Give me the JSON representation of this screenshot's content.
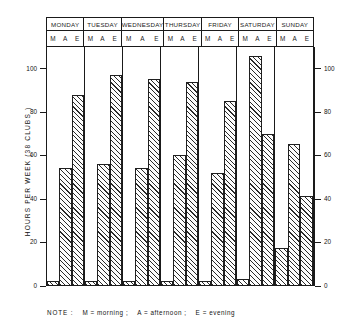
{
  "chart_data": {
    "type": "bar",
    "title": "",
    "subtitle": "",
    "xlabel": "",
    "ylabel": "HOURS  PER  WEEK  (38 CLUBS )",
    "ylim": [
      0,
      110
    ],
    "y_ticks": [
      0,
      20,
      40,
      60,
      80,
      100
    ],
    "y_tick_labels": [
      "0",
      "20",
      "40",
      "60",
      "80",
      "100"
    ],
    "dual_y_axis": true,
    "grid": false,
    "legend": "none",
    "categories": [
      "MONDAY",
      "TUESDAY",
      "WEDNESDAY",
      "THURSDAY",
      "FRIDAY",
      "SATURDAY",
      "SUNDAY"
    ],
    "subcategories": [
      "M",
      "A",
      "E"
    ],
    "series": [
      {
        "name": "M",
        "values": [
          2,
          2,
          2,
          2,
          2,
          3,
          17
        ]
      },
      {
        "name": "A",
        "values": [
          54,
          56,
          54,
          60,
          52,
          106,
          65
        ]
      },
      {
        "name": "E",
        "values": [
          88,
          97,
          95,
          94,
          85,
          70,
          41
        ]
      }
    ],
    "annotation": "NOTE :   M = morning ;   A = afternoon ;   E = evening"
  },
  "axis": {
    "title": "HOURS  PER  WEEK  (38 CLUBS )",
    "ticks": [
      {
        "value": 100,
        "label": "100"
      },
      {
        "value": 80,
        "label": "80"
      },
      {
        "value": 60,
        "label": "60"
      },
      {
        "value": 40,
        "label": "40"
      },
      {
        "value": 20,
        "label": "20"
      },
      {
        "value": 0,
        "label": "0"
      }
    ]
  },
  "header": {
    "days": [
      {
        "name": "MONDAY",
        "slots": [
          "M",
          "A",
          "E"
        ]
      },
      {
        "name": "TUESDAY",
        "slots": [
          "M",
          "A",
          "E"
        ]
      },
      {
        "name": "WEDNESDAY",
        "slots": [
          "M",
          "A",
          "E"
        ]
      },
      {
        "name": "THURSDAY",
        "slots": [
          "M",
          "A",
          "E"
        ]
      },
      {
        "name": "FRIDAY",
        "slots": [
          "M",
          "A",
          "E"
        ]
      },
      {
        "name": "SATURDAY",
        "slots": [
          "M",
          "A",
          "E"
        ]
      },
      {
        "name": "SUNDAY",
        "slots": [
          "M",
          "A",
          "E"
        ]
      }
    ]
  },
  "note": {
    "label": "NOTE :",
    "items": [
      "M = morning ;",
      "A = afternoon ;",
      "E = evening"
    ]
  }
}
